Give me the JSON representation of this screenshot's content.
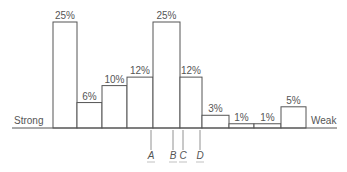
{
  "chart_data": {
    "type": "bar",
    "title": "",
    "xlabel": "",
    "ylabel": "",
    "categories": [
      "1",
      "2",
      "3",
      "4",
      "5",
      "6",
      "7",
      "8",
      "9",
      "10"
    ],
    "values": [
      25,
      6,
      10,
      12,
      25,
      12,
      3,
      1,
      1,
      5
    ],
    "value_labels": [
      "25%",
      "6%",
      "10%",
      "12%",
      "25%",
      "12%",
      "3%",
      "1%",
      "1%",
      "5%"
    ],
    "axis_left_label": "Strong",
    "axis_right_label": "Weak",
    "markers": [
      {
        "label": "A",
        "position": "boundary between bar 4 and bar 5"
      },
      {
        "label": "B",
        "position": "within bar 5, near right edge"
      },
      {
        "label": "C",
        "position": "within bar 6, near left edge"
      },
      {
        "label": "D",
        "position": "boundary between bar 6 and bar 7"
      }
    ],
    "ylim": [
      0,
      25
    ],
    "grid": false,
    "legend": "none"
  },
  "axis": {
    "left_label": "Strong",
    "right_label": "Weak"
  },
  "markers": [
    "A",
    "B",
    "C",
    "D"
  ]
}
